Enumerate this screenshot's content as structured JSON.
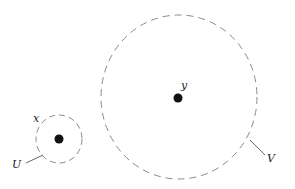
{
  "diagram": {
    "neighborhoods": [
      {
        "name": "U",
        "point_label": "x",
        "boundary_label": "U",
        "center": [
          59,
          139
        ],
        "radius": [
          23,
          24
        ],
        "label_point_pos": [
          33,
          122
        ],
        "label_boundary_pos": [
          12,
          168
        ],
        "leader": [
          [
            26,
            163
          ],
          [
            43,
            155
          ]
        ]
      },
      {
        "name": "V",
        "point_label": "y",
        "boundary_label": "V",
        "center": [
          179,
          97
        ],
        "radius": [
          78,
          82
        ],
        "label_point_pos": [
          181,
          89
        ],
        "label_boundary_pos": [
          267,
          162
        ],
        "leader": [
          [
            250,
            140
          ],
          [
            265,
            155
          ]
        ]
      }
    ],
    "colors": {
      "boundary": "#8a8a8a",
      "point": "#111111",
      "leader": "#555555"
    }
  }
}
